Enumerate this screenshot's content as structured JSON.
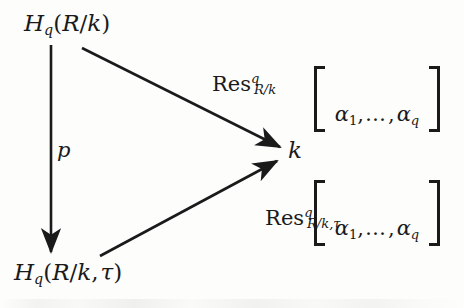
{
  "diagram": {
    "kind": "commutative-diagram",
    "background_color": "#fdfdfc",
    "ink_color": "#1a1a1a",
    "nodes": {
      "top_left": {
        "name": "H_q(R/k)",
        "base": "H",
        "subscript": "q",
        "open_paren": "(",
        "arg": "R",
        "slash": "/",
        "arg2": "k",
        "close_paren": ")"
      },
      "bottom_left": {
        "name": "H_q(R/k, tau)",
        "base": "H",
        "subscript": "q",
        "open_paren": "(",
        "arg": "R",
        "slash": "/",
        "arg2": "k",
        "comma": ",",
        "arg3": "τ",
        "close_paren": ")"
      },
      "center": {
        "name": "k",
        "label": "k"
      }
    },
    "arrows": [
      {
        "id": "vertical-p",
        "from": "top_left",
        "to": "bottom_left",
        "label": "p",
        "direction": "down"
      },
      {
        "id": "res-top",
        "from": "top_left",
        "to": "center",
        "label": "Res^q_{R/k}",
        "direction": "down-right"
      },
      {
        "id": "res-bottom",
        "from": "bottom_left",
        "to": "center",
        "label": "Res^q_{R/k,tau}",
        "direction": "up-right"
      }
    ],
    "labels": {
      "p": "p",
      "res_top": {
        "operator": "Res",
        "superscript": "q",
        "subscript_num": "R",
        "subscript_slash": "/",
        "subscript_den": "k"
      },
      "res_bottom": {
        "operator": "Res",
        "superscript": "q",
        "subscript_num": "R",
        "subscript_slash": "/",
        "subscript_den": "k",
        "subscript_comma": ",",
        "subscript_tau": "τ"
      }
    },
    "brackets": {
      "top": {
        "open": "[",
        "close": "]",
        "first": "α",
        "first_sub": "1",
        "comma1": ",",
        "ellipsis": "…",
        "comma2": ",",
        "last": "α",
        "last_sub": "q"
      },
      "bottom": {
        "open": "[",
        "close": "]",
        "first": "α",
        "first_sub": "1",
        "comma1": ",",
        "ellipsis": "…",
        "comma2": ",",
        "last": "α",
        "last_sub": "q"
      }
    }
  }
}
